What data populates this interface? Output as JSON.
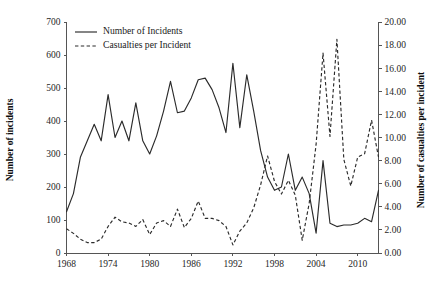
{
  "chart_data": {
    "type": "line",
    "title": "",
    "xlabel": "",
    "ylabel": "Number of incidents",
    "y2label": "Number of casualties per incident",
    "grid": false,
    "legend_position": "top-left",
    "xlim": [
      1968,
      2013
    ],
    "ylim": [
      0,
      700
    ],
    "y2lim": [
      0,
      20
    ],
    "xticks": [
      "1968",
      "1974",
      "1980",
      "1986",
      "1992",
      "1998",
      "2004",
      "2010"
    ],
    "xtick_values": [
      1968,
      1974,
      1980,
      1986,
      1992,
      1998,
      2004,
      2010
    ],
    "yticks": [
      "0",
      "100",
      "200",
      "300",
      "400",
      "500",
      "600",
      "700"
    ],
    "ytick_values": [
      0,
      100,
      200,
      300,
      400,
      500,
      600,
      700
    ],
    "y2ticks": [
      "0.00",
      "2.00",
      "4.00",
      "6.00",
      "8.00",
      "10.00",
      "12.00",
      "14.00",
      "16.00",
      "18.00",
      "20.00"
    ],
    "y2tick_values": [
      0,
      2,
      4,
      6,
      8,
      10,
      12,
      14,
      16,
      18,
      20
    ],
    "x": [
      1968,
      1969,
      1970,
      1971,
      1972,
      1973,
      1974,
      1975,
      1976,
      1977,
      1978,
      1979,
      1980,
      1981,
      1982,
      1983,
      1984,
      1985,
      1986,
      1987,
      1988,
      1989,
      1990,
      1991,
      1992,
      1993,
      1994,
      1995,
      1996,
      1997,
      1998,
      1999,
      2000,
      2001,
      2002,
      2003,
      2004,
      2005,
      2006,
      2007,
      2008,
      2009,
      2010,
      2011,
      2012,
      2013
    ],
    "series": [
      {
        "name": "Number of Incidents",
        "axis": "left",
        "style": "solid",
        "values": [
          125,
          180,
          290,
          340,
          390,
          340,
          480,
          350,
          400,
          340,
          455,
          340,
          300,
          355,
          430,
          520,
          425,
          430,
          470,
          525,
          530,
          495,
          440,
          365,
          575,
          380,
          540,
          430,
          310,
          230,
          190,
          200,
          300,
          190,
          230,
          180,
          60,
          280,
          90,
          80,
          85,
          85,
          90,
          105,
          95,
          190
        ]
      },
      {
        "name": "Casualties per Incident",
        "axis": "right",
        "style": "dashed",
        "values": [
          2.1,
          1.7,
          1.2,
          0.9,
          0.9,
          1.2,
          2.3,
          3.1,
          2.7,
          2.6,
          2.3,
          2.9,
          1.6,
          2.6,
          2.8,
          2.3,
          3.8,
          2.2,
          3.0,
          4.5,
          3.0,
          3.0,
          2.8,
          2.3,
          0.7,
          1.9,
          2.6,
          3.9,
          5.9,
          8.4,
          6.2,
          5.1,
          6.3,
          5.0,
          1.1,
          4.3,
          9.4,
          17.3,
          10.1,
          18.5,
          8.1,
          5.8,
          8.3,
          8.6,
          11.5,
          8.3
        ]
      }
    ],
    "legend": [
      {
        "label": "Number of Incidents",
        "style": "solid"
      },
      {
        "label": "Casualties per Incident",
        "style": "dashed"
      }
    ]
  }
}
